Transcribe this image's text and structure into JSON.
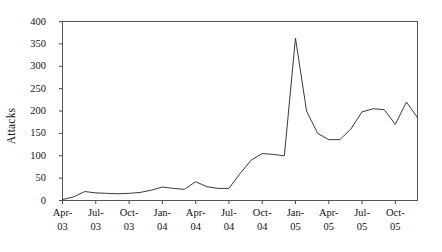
{
  "chart_data": {
    "type": "line",
    "title": "",
    "subtitle": "",
    "xlabel": "",
    "ylabel": "Attacks",
    "ylim": [
      0,
      400
    ],
    "ytick_step": 50,
    "ytick_labels": [
      "400",
      "350",
      "300",
      "250",
      "200",
      "150",
      "100",
      "50",
      "0"
    ],
    "ytick_values": [
      400,
      350,
      300,
      250,
      200,
      150,
      100,
      50,
      0
    ],
    "grid": false,
    "legend": false,
    "legend_position": "none",
    "xtick_labels": [
      {
        "line1": "Apr-",
        "line2": "03"
      },
      {
        "line1": "Jul-",
        "line2": "03"
      },
      {
        "line1": "Oct-",
        "line2": "03"
      },
      {
        "line1": "Jan-",
        "line2": "04"
      },
      {
        "line1": "Apr-",
        "line2": "04"
      },
      {
        "line1": "Jul-",
        "line2": "04"
      },
      {
        "line1": "Oct-",
        "line2": "04"
      },
      {
        "line1": "Jan-",
        "line2": "05"
      },
      {
        "line1": "Apr-",
        "line2": "05"
      },
      {
        "line1": "Jul-",
        "line2": "05"
      },
      {
        "line1": "Oct-",
        "line2": "05"
      }
    ],
    "xtick_major_every": 3,
    "x": [
      "Apr-03",
      "May-03",
      "Jun-03",
      "Jul-03",
      "Aug-03",
      "Sep-03",
      "Oct-03",
      "Nov-03",
      "Dec-03",
      "Jan-04",
      "Feb-04",
      "Mar-04",
      "Apr-04",
      "May-04",
      "Jun-04",
      "Jul-04",
      "Aug-04",
      "Sep-04",
      "Oct-04",
      "Nov-04",
      "Dec-04",
      "Jan-05",
      "Feb-05",
      "Mar-05",
      "Apr-05",
      "May-05",
      "Jun-05",
      "Jul-05",
      "Aug-05",
      "Sep-05",
      "Oct-05",
      "Nov-05",
      "Dec-05"
    ],
    "series": [
      {
        "name": "Attacks",
        "color": "#3a3a3a",
        "values": [
          2,
          8,
          20,
          17,
          16,
          15,
          16,
          18,
          23,
          30,
          27,
          25,
          42,
          31,
          27,
          27,
          60,
          90,
          105,
          103,
          100,
          363,
          200,
          150,
          136,
          136,
          160,
          198,
          205,
          203,
          170,
          220,
          185
        ]
      }
    ],
    "annotations": [],
    "axis_color": "#555555",
    "text_color": "#121212",
    "background": "#ffffff"
  }
}
